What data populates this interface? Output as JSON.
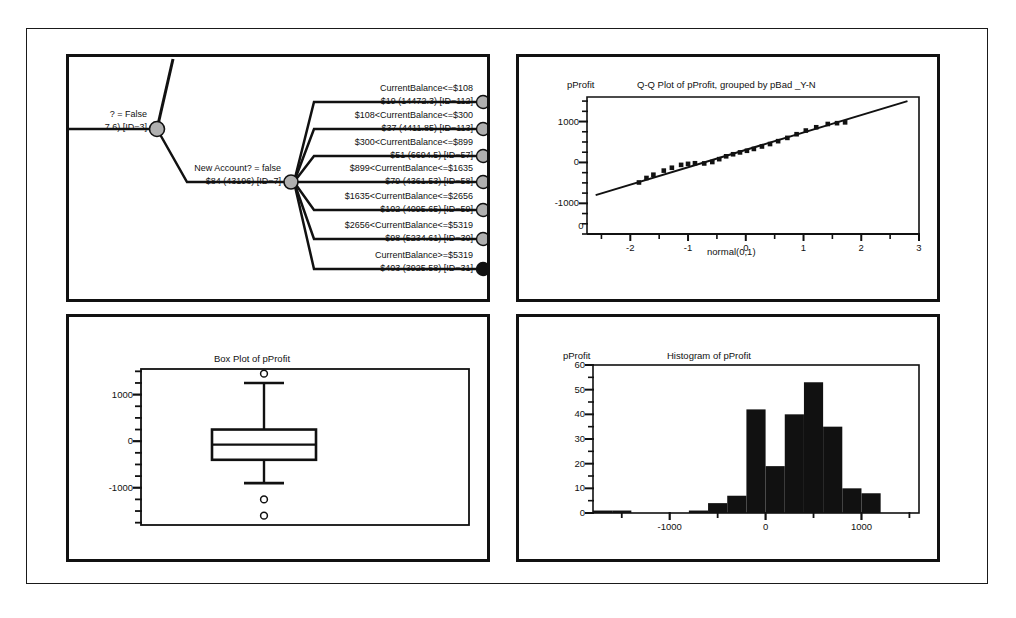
{
  "figure": {
    "background": "#ffffff",
    "line_color": "#111111"
  },
  "panels": {
    "tree": {
      "name": "Decision tree panel",
      "root_node": {
        "label_top": "? = False",
        "label_bottom": "7.6)  [ID=3]"
      },
      "split_node": {
        "label_top": "New Account? = false",
        "label_bottom": "$84 (43196)  [ID=7]"
      },
      "leaves": [
        {
          "condition": "CurrentBalance<=$108",
          "stats": "$19 (14472.3)  [ID=112]",
          "marker": "gray"
        },
        {
          "condition": "$108<CurrentBalance<=$300",
          "stats": "$37 (4411.85)  [ID=113]",
          "marker": "gray"
        },
        {
          "condition": "$300<CurrentBalance<=$899",
          "stats": "$51 (6694.5)  [ID=57]",
          "marker": "gray"
        },
        {
          "condition": "$899<CurrentBalance<=$1635",
          "stats": "$79 (4361.53)  [ID=58]",
          "marker": "gray"
        },
        {
          "condition": "$1635<CurrentBalance<=$2656",
          "stats": "$102 (4095.65)  [ID=59]",
          "marker": "gray"
        },
        {
          "condition": "$2656<CurrentBalance<=$5319",
          "stats": "$98 (5234.61)  [ID=30]",
          "marker": "gray"
        },
        {
          "condition": "CurrentBalance>=$5319",
          "stats": "$403 (3925.58)  [ID=31]",
          "marker": "black"
        }
      ]
    }
  },
  "chart_data": [
    {
      "id": "qq-plot",
      "type": "scatter",
      "title": "Q-Q Plot of pProfit, grouped by pBad _Y-N",
      "ylabel": "pProfit",
      "xlabel": "normal(0,1)",
      "origin_label": "0",
      "xlim": [
        -2.75,
        3.0
      ],
      "ylim": [
        -1750,
        1600
      ],
      "xticks": [
        -2,
        -1,
        0,
        1,
        2,
        3
      ],
      "xtick_labels": [
        "-2",
        "-1",
        "0",
        "1",
        "2",
        "3"
      ],
      "yticks": [
        1000,
        0,
        -1000
      ],
      "ytick_labels": [
        "1000",
        "0",
        "-1000"
      ],
      "minor_x_step": 0.5,
      "minor_y_step": 250,
      "grid": false,
      "reference_line": {
        "x": [
          -2.6,
          2.8
        ],
        "y": [
          -800,
          1500
        ]
      },
      "x": [
        -1.85,
        -1.72,
        -1.6,
        -1.42,
        -1.28,
        -1.12,
        -1.0,
        -0.88,
        -0.72,
        -0.58,
        -0.46,
        -0.34,
        -0.22,
        -0.1,
        0.02,
        0.14,
        0.28,
        0.42,
        0.56,
        0.72,
        0.88,
        1.04,
        1.22,
        1.42,
        1.58,
        1.72
      ],
      "y": [
        -490,
        -380,
        -300,
        -200,
        -130,
        -60,
        -35,
        -20,
        -25,
        10,
        80,
        150,
        200,
        245,
        285,
        330,
        390,
        450,
        520,
        600,
        690,
        780,
        860,
        940,
        960,
        980
      ]
    },
    {
      "id": "box-plot",
      "type": "box",
      "title": "Box Plot of pProfit",
      "ylim": [
        -1800,
        1550
      ],
      "yticks": [
        1000,
        0,
        -1000
      ],
      "ytick_labels": [
        "1000",
        "0",
        "-1000"
      ],
      "minor_y_step": 250,
      "grid": false,
      "box": {
        "whisker_high": 1250,
        "q3": 250,
        "median": -75,
        "q1": -400,
        "whisker_low": -900
      },
      "outliers": [
        1450,
        -1250,
        -1600
      ]
    },
    {
      "id": "histogram",
      "type": "bar",
      "title": "Histogram of pProfit",
      "ylabel": "pProfit",
      "xlim": [
        -1800,
        1600
      ],
      "ylim": [
        0,
        60
      ],
      "yticks": [
        0,
        10,
        20,
        30,
        40,
        50,
        60
      ],
      "ytick_labels": [
        "0",
        "10",
        "20",
        "30",
        "40",
        "50",
        "60"
      ],
      "xticks": [
        -1000,
        0,
        1000
      ],
      "xtick_labels": [
        "-1000",
        "0",
        "1000"
      ],
      "minor_y_step": 5,
      "minor_x_step": 500,
      "grid": false,
      "bin_edges": [
        -1800,
        -1600,
        -1400,
        -1200,
        -1000,
        -800,
        -600,
        -400,
        -200,
        0,
        200,
        400,
        600,
        800,
        1000,
        1200,
        1400,
        1600
      ],
      "values": [
        1,
        1,
        0,
        0,
        0,
        1,
        4,
        7,
        42,
        19,
        40,
        53,
        35,
        10,
        8,
        0,
        0
      ]
    }
  ]
}
